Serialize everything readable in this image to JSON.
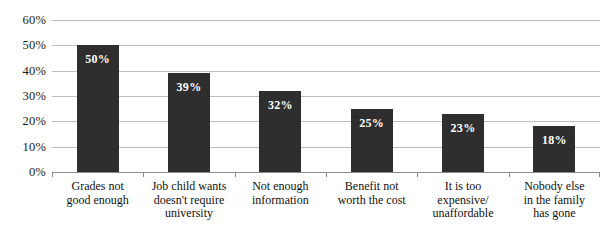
{
  "chart_data": {
    "type": "bar",
    "title": "",
    "subtitle": "",
    "xlabel": "",
    "ylabel": "",
    "ylim": [
      0,
      60
    ],
    "y_tick_labels": [
      "0%",
      "10%",
      "20%",
      "30%",
      "40%",
      "50%",
      "60%"
    ],
    "y_ticks": [
      0,
      10,
      20,
      30,
      40,
      50,
      60
    ],
    "grid": true,
    "legend": false,
    "legend_position": "none",
    "orientation": "vertical",
    "bar_color": "#2e2e2e",
    "value_label_color": "#ffffff",
    "gridline_color": "#bdbdbd",
    "axis_color": "#8a8a8a",
    "categories": [
      "Grades not\ngood enough",
      "Job child wants\ndoesn't require\nuniversity",
      "Not enough\ninformation",
      "Benefit not\nworth the cost",
      "It is too\nexpensive/\nunaffordable",
      "Nobody else\nin the family\nhas gone"
    ],
    "values": [
      50,
      39,
      32,
      25,
      23,
      18
    ],
    "value_labels": [
      "50%",
      "39%",
      "32%",
      "25%",
      "23%",
      "18%"
    ]
  }
}
